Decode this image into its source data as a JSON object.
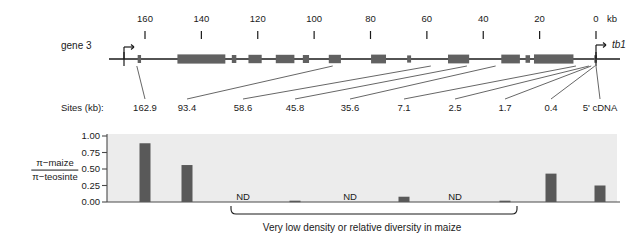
{
  "figure": {
    "gene_label": "gene 3",
    "target_gene_label": "tb1",
    "axis_unit": "kb",
    "axis_ticks": [
      160,
      140,
      120,
      100,
      80,
      60,
      40,
      20,
      0
    ],
    "sites_row_label": "Sites (kb):",
    "sites": [
      "162.9",
      "93.4",
      "58.6",
      "45.8",
      "35.6",
      "7.1",
      "2.5",
      "1.7",
      "0.4",
      "5' cDNA"
    ],
    "bracket_caption": "Very low density or relative diversity in maize",
    "nd_label": "ND",
    "colors": {
      "bar": "#595959",
      "exon": "#616161",
      "plot_background": "#ececec",
      "axis_line": "#1a1a1a",
      "leader_line": "#555555"
    }
  },
  "chart_data": {
    "type": "bar",
    "title": "",
    "xlabel": "",
    "ylabel_numerator": "π−maize",
    "ylabel_denominator": "π−teosinte",
    "ylim": [
      0.0,
      1.0
    ],
    "yticks": [
      "1.00",
      "0.75",
      "0.50",
      "0.25",
      "0.00"
    ],
    "ytick_values": [
      1.0,
      0.75,
      0.5,
      0.25,
      0.0
    ],
    "grid": false,
    "legend": "none",
    "categories": [
      "162.9",
      "93.4",
      "58.6",
      "45.8",
      "35.6",
      "7.1",
      "2.5",
      "1.7",
      "0.4",
      "5' cDNA"
    ],
    "values": [
      0.89,
      0.56,
      null,
      0.02,
      null,
      0.08,
      null,
      0.02,
      0.43,
      0.25
    ],
    "nd_categories": [
      "58.6",
      "35.6",
      "2.5"
    ],
    "bracket_span": [
      "58.6",
      "1.7"
    ],
    "annotations": [
      {
        "text": "ND",
        "category": "58.6"
      },
      {
        "text": "ND",
        "category": "35.6"
      },
      {
        "text": "ND",
        "category": "2.5"
      }
    ]
  }
}
